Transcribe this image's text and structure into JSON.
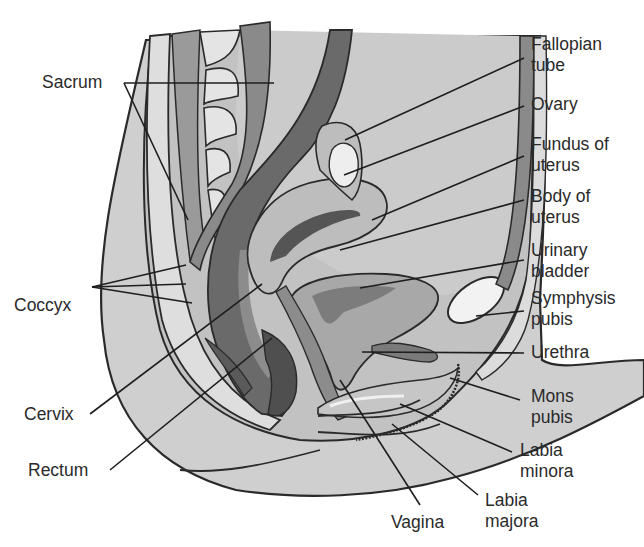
{
  "diagram": {
    "colors": {
      "background": "#ffffff",
      "body_fill": "#cfcfcf",
      "outline": "#2a2a2a",
      "dark_tissue": "#6e6e6e",
      "mid_tissue": "#9a9a9a",
      "light_tissue": "#bdbdbd",
      "bone_light": "#e2e2e2",
      "leader_line": "#1e1e1e"
    },
    "labels_left": [
      {
        "id": "sacrum",
        "lines": [
          "Sacrum"
        ]
      },
      {
        "id": "coccyx",
        "lines": [
          "Coccyx"
        ]
      },
      {
        "id": "cervix",
        "lines": [
          "Cervix"
        ]
      },
      {
        "id": "rectum",
        "lines": [
          "Rectum"
        ]
      }
    ],
    "labels_right": [
      {
        "id": "fallopian-tube",
        "lines": [
          "Fallopian",
          "tube"
        ]
      },
      {
        "id": "ovary",
        "lines": [
          "Ovary"
        ]
      },
      {
        "id": "fundus-of-uterus",
        "lines": [
          "Fundus of",
          "uterus"
        ]
      },
      {
        "id": "body-of-uterus",
        "lines": [
          "Body of",
          "uterus"
        ]
      },
      {
        "id": "urinary-bladder",
        "lines": [
          "Urinary",
          "bladder"
        ]
      },
      {
        "id": "symphysis-pubis",
        "lines": [
          "Symphysis",
          "pubis"
        ]
      },
      {
        "id": "urethra",
        "lines": [
          "Urethra"
        ]
      },
      {
        "id": "mons-pubis",
        "lines": [
          "Mons",
          "pubis"
        ]
      }
    ],
    "labels_bottom": [
      {
        "id": "labia-minora",
        "lines": [
          "Labia",
          "minora"
        ]
      },
      {
        "id": "labia-majora",
        "lines": [
          "Labia",
          "majora"
        ]
      },
      {
        "id": "vagina",
        "lines": [
          "Vagina"
        ]
      }
    ]
  }
}
